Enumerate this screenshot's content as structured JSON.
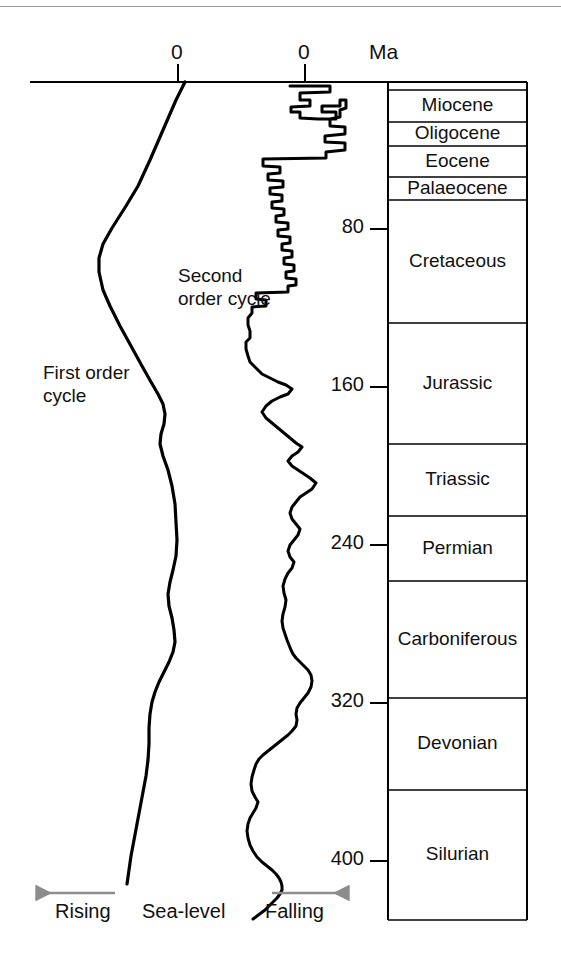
{
  "figure": {
    "type": "geologic-sea-level-curve",
    "ma_axis_label": "Ma",
    "zero_label_left": "0",
    "zero_label_right": "0",
    "annotations": {
      "first_order": "First order\ncycle",
      "first_order_line1": "First order",
      "first_order_line2": "cycle",
      "second_order_line1": "Second",
      "second_order_line2": "order  cycle"
    },
    "footer": {
      "rising": "Rising",
      "sea_level": "Sea-level",
      "falling": "Falling",
      "arrow_color": "#8c8c8c"
    }
  },
  "chart_data": {
    "type": "line",
    "title": "",
    "xlabel": "Sea-level",
    "ylabel": "Ma",
    "ylim": [
      0,
      440
    ],
    "y_ticks": [
      80,
      160,
      240,
      320,
      400
    ],
    "y_tick_labels": [
      "80",
      "160",
      "240",
      "320",
      "400"
    ],
    "grid": false,
    "legend_position": "inline-annotations",
    "x_axis_note": "Two independent zero datums: first order cycle (left) and second order cycle (right); left = rising sea-level, right = falling sea-level",
    "series": [
      {
        "name": "First order cycle",
        "zero_x_px": 178,
        "points_px": [
          [
            185,
            82
          ],
          [
            176,
            100
          ],
          [
            163,
            130
          ],
          [
            150,
            160
          ],
          [
            138,
            186
          ],
          [
            126,
            206
          ],
          [
            112,
            228
          ],
          [
            103,
            244
          ],
          [
            99,
            258
          ],
          [
            99,
            272
          ],
          [
            103,
            290
          ],
          [
            110,
            306
          ],
          [
            120,
            326
          ],
          [
            131,
            346
          ],
          [
            142,
            366
          ],
          [
            151,
            382
          ],
          [
            158,
            394
          ],
          [
            163,
            404
          ],
          [
            165,
            414
          ],
          [
            164,
            424
          ],
          [
            161,
            434
          ],
          [
            160,
            444
          ],
          [
            163,
            456
          ],
          [
            168,
            470
          ],
          [
            172,
            486
          ],
          [
            175,
            504
          ],
          [
            176,
            522
          ],
          [
            177,
            540
          ],
          [
            176,
            556
          ],
          [
            173,
            570
          ],
          [
            170,
            582
          ],
          [
            168,
            594
          ],
          [
            169,
            606
          ],
          [
            172,
            618
          ],
          [
            174,
            630
          ],
          [
            175,
            642
          ],
          [
            173,
            652
          ],
          [
            169,
            662
          ],
          [
            164,
            672
          ],
          [
            159,
            682
          ],
          [
            155,
            692
          ],
          [
            152,
            702
          ],
          [
            150,
            714
          ],
          [
            149,
            728
          ],
          [
            149,
            744
          ],
          [
            148,
            760
          ],
          [
            146,
            776
          ],
          [
            143,
            792
          ],
          [
            140,
            808
          ],
          [
            137,
            824
          ],
          [
            134,
            840
          ],
          [
            131,
            856
          ],
          [
            129,
            870
          ],
          [
            127,
            884
          ]
        ]
      },
      {
        "name": "Second order cycle",
        "zero_x_px": 305,
        "points_px": [
          [
            290,
            86
          ],
          [
            330,
            86
          ],
          [
            330,
            92
          ],
          [
            300,
            93
          ],
          [
            300,
            100
          ],
          [
            310,
            100
          ],
          [
            310,
            106
          ],
          [
            291,
            107
          ],
          [
            291,
            112
          ],
          [
            300,
            112
          ],
          [
            300,
            118
          ],
          [
            318,
            119
          ],
          [
            336,
            119
          ],
          [
            336,
            112
          ],
          [
            322,
            112
          ],
          [
            322,
            106
          ],
          [
            340,
            106
          ],
          [
            340,
            100
          ],
          [
            346,
            100
          ],
          [
            346,
            108
          ],
          [
            340,
            110
          ],
          [
            340,
            117
          ],
          [
            330,
            119
          ],
          [
            330,
            126
          ],
          [
            345,
            127
          ],
          [
            345,
            134
          ],
          [
            325,
            136
          ],
          [
            325,
            142
          ],
          [
            345,
            143
          ],
          [
            345,
            150
          ],
          [
            326,
            152
          ],
          [
            326,
            158
          ],
          [
            263,
            159
          ],
          [
            263,
            166
          ],
          [
            280,
            167
          ],
          [
            280,
            173
          ],
          [
            268,
            174
          ],
          [
            268,
            180
          ],
          [
            283,
            181
          ],
          [
            283,
            187
          ],
          [
            270,
            188
          ],
          [
            270,
            194
          ],
          [
            282,
            195
          ],
          [
            282,
            201
          ],
          [
            272,
            202
          ],
          [
            272,
            208
          ],
          [
            284,
            209
          ],
          [
            284,
            215
          ],
          [
            276,
            216
          ],
          [
            276,
            222
          ],
          [
            288,
            223
          ],
          [
            288,
            229
          ],
          [
            278,
            230
          ],
          [
            278,
            236
          ],
          [
            290,
            237
          ],
          [
            290,
            243
          ],
          [
            282,
            244
          ],
          [
            282,
            250
          ],
          [
            292,
            251
          ],
          [
            292,
            257
          ],
          [
            284,
            258
          ],
          [
            284,
            264
          ],
          [
            294,
            265
          ],
          [
            294,
            271
          ],
          [
            286,
            272
          ],
          [
            286,
            278
          ],
          [
            296,
            279
          ],
          [
            296,
            285
          ],
          [
            288,
            286
          ],
          [
            288,
            292
          ],
          [
            256,
            293
          ],
          [
            256,
            299
          ],
          [
            266,
            300
          ],
          [
            266,
            306
          ],
          [
            252,
            307
          ],
          [
            252,
            313
          ],
          [
            248,
            318
          ],
          [
            248,
            325
          ],
          [
            250,
            331
          ],
          [
            250,
            338
          ],
          [
            246,
            342
          ],
          [
            246,
            349
          ],
          [
            248,
            356
          ],
          [
            250,
            362
          ],
          [
            256,
            368
          ],
          [
            262,
            374
          ],
          [
            270,
            378
          ],
          [
            278,
            382
          ],
          [
            286,
            385
          ],
          [
            292,
            389
          ],
          [
            288,
            394
          ],
          [
            280,
            397
          ],
          [
            272,
            401
          ],
          [
            266,
            406
          ],
          [
            262,
            412
          ],
          [
            266,
            418
          ],
          [
            272,
            423
          ],
          [
            278,
            428
          ],
          [
            284,
            433
          ],
          [
            290,
            438
          ],
          [
            296,
            443
          ],
          [
            302,
            447
          ],
          [
            298,
            452
          ],
          [
            292,
            456
          ],
          [
            288,
            461
          ],
          [
            292,
            466
          ],
          [
            298,
            470
          ],
          [
            304,
            474
          ],
          [
            310,
            478
          ],
          [
            316,
            483
          ],
          [
            312,
            489
          ],
          [
            306,
            493
          ],
          [
            300,
            497
          ],
          [
            296,
            502
          ],
          [
            292,
            507
          ],
          [
            290,
            513
          ],
          [
            292,
            519
          ],
          [
            296,
            524
          ],
          [
            300,
            529
          ],
          [
            298,
            535
          ],
          [
            294,
            540
          ],
          [
            290,
            545
          ],
          [
            288,
            551
          ],
          [
            290,
            557
          ],
          [
            294,
            562
          ],
          [
            292,
            568
          ],
          [
            288,
            573
          ],
          [
            285,
            579
          ],
          [
            283,
            586
          ],
          [
            284,
            593
          ],
          [
            286,
            600
          ],
          [
            285,
            607
          ],
          [
            283,
            614
          ],
          [
            282,
            621
          ],
          [
            283,
            628
          ],
          [
            285,
            634
          ],
          [
            287,
            640
          ],
          [
            289,
            645
          ],
          [
            291,
            650
          ],
          [
            293,
            654
          ],
          [
            296,
            658
          ],
          [
            300,
            662
          ],
          [
            304,
            666
          ],
          [
            308,
            670
          ],
          [
            311,
            675
          ],
          [
            312,
            681
          ],
          [
            311,
            687
          ],
          [
            308,
            693
          ],
          [
            304,
            698
          ],
          [
            300,
            703
          ],
          [
            297,
            708
          ],
          [
            296,
            714
          ],
          [
            297,
            720
          ],
          [
            296,
            726
          ],
          [
            292,
            731
          ],
          [
            288,
            735
          ],
          [
            283,
            739
          ],
          [
            278,
            743
          ],
          [
            273,
            747
          ],
          [
            268,
            751
          ],
          [
            263,
            755
          ],
          [
            259,
            759
          ],
          [
            256,
            764
          ],
          [
            254,
            770
          ],
          [
            252,
            777
          ],
          [
            251,
            784
          ],
          [
            252,
            791
          ],
          [
            255,
            797
          ],
          [
            258,
            802
          ],
          [
            256,
            808
          ],
          [
            253,
            813
          ],
          [
            250,
            818
          ],
          [
            248,
            824
          ],
          [
            247,
            831
          ],
          [
            248,
            838
          ],
          [
            250,
            845
          ],
          [
            253,
            851
          ],
          [
            257,
            857
          ],
          [
            262,
            862
          ],
          [
            267,
            866
          ],
          [
            272,
            870
          ],
          [
            276,
            874
          ],
          [
            279,
            878
          ],
          [
            281,
            882
          ],
          [
            282,
            886
          ],
          [
            282,
            890
          ],
          [
            280,
            894
          ],
          [
            277,
            898
          ],
          [
            273,
            902
          ],
          [
            269,
            906
          ],
          [
            265,
            910
          ],
          [
            261,
            913
          ],
          [
            257,
            916
          ],
          [
            253,
            919
          ]
        ]
      }
    ]
  },
  "strat_column": {
    "left_px": 388,
    "right_px": 527,
    "top_px": 82,
    "bottom_px": 920,
    "units": [
      {
        "label": "",
        "top_px": 82,
        "bottom_px": 90
      },
      {
        "label": "Miocene",
        "top_px": 90,
        "bottom_px": 122
      },
      {
        "label": "Oligocene",
        "top_px": 122,
        "bottom_px": 146
      },
      {
        "label": "Eocene",
        "top_px": 146,
        "bottom_px": 177
      },
      {
        "label": "Palaeocene",
        "top_px": 177,
        "bottom_px": 200
      },
      {
        "label": "Cretaceous",
        "top_px": 200,
        "bottom_px": 323
      },
      {
        "label": "Jurassic",
        "top_px": 323,
        "bottom_px": 444
      },
      {
        "label": "Triassic",
        "top_px": 444,
        "bottom_px": 516
      },
      {
        "label": "Permian",
        "top_px": 516,
        "bottom_px": 581
      },
      {
        "label": "Carboniferous",
        "top_px": 581,
        "bottom_px": 698
      },
      {
        "label": "Devonian",
        "top_px": 698,
        "bottom_px": 790
      },
      {
        "label": "Silurian",
        "top_px": 790,
        "bottom_px": 920
      }
    ]
  }
}
